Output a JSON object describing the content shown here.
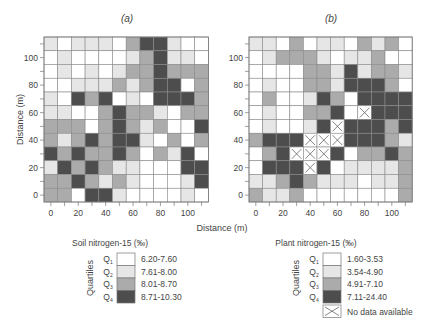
{
  "chart_data": [
    {
      "type": "heatmap",
      "panel_label": "(a)",
      "title": "(a)",
      "xlabel": "Distance (m)",
      "ylabel": "Distance (m)",
      "x_ticks": [
        "0",
        "20",
        "40",
        "60",
        "80",
        "100"
      ],
      "y_ticks": [
        "0",
        "20",
        "40",
        "60",
        "80",
        "100"
      ],
      "x_range": [
        0,
        110
      ],
      "y_range": [
        0,
        110
      ],
      "cell_spacing_m": 10,
      "rows_top_to_bottom": [
        [
          2,
          1,
          2,
          2,
          2,
          1,
          3,
          4,
          4,
          2,
          1,
          1
        ],
        [
          1,
          2,
          1,
          1,
          1,
          1,
          2,
          3,
          4,
          2,
          2,
          1
        ],
        [
          1,
          2,
          1,
          2,
          1,
          2,
          3,
          3,
          4,
          3,
          3,
          3
        ],
        [
          1,
          1,
          2,
          2,
          2,
          3,
          2,
          3,
          4,
          4,
          1,
          3
        ],
        [
          2,
          1,
          4,
          3,
          4,
          1,
          2,
          1,
          4,
          4,
          4,
          3
        ],
        [
          2,
          2,
          1,
          1,
          3,
          4,
          3,
          3,
          2,
          1,
          3,
          3
        ],
        [
          3,
          3,
          3,
          1,
          3,
          4,
          3,
          2,
          3,
          1,
          1,
          4
        ],
        [
          3,
          2,
          3,
          4,
          3,
          4,
          4,
          2,
          1,
          3,
          1,
          3
        ],
        [
          4,
          3,
          4,
          3,
          3,
          4,
          3,
          1,
          3,
          2,
          4,
          1
        ],
        [
          2,
          4,
          3,
          4,
          3,
          2,
          2,
          1,
          1,
          1,
          4,
          4
        ],
        [
          3,
          3,
          4,
          3,
          2,
          3,
          2,
          1,
          1,
          1,
          2,
          4
        ],
        [
          3,
          3,
          1,
          4,
          4,
          2,
          1,
          1,
          1,
          1,
          2,
          1
        ]
      ],
      "legend": {
        "title": "Soil nitrogen-15 (‰)",
        "axis_label": "Quartiles",
        "entries": [
          {
            "quartile": "Q1",
            "range": "6.20-7.60"
          },
          {
            "quartile": "Q2",
            "range": "7.61-8.00"
          },
          {
            "quartile": "Q3",
            "range": "8.01-8.70"
          },
          {
            "quartile": "Q4",
            "range": "8.71-10.30"
          }
        ]
      }
    },
    {
      "type": "heatmap",
      "panel_label": "(b)",
      "title": "(b)",
      "xlabel": "Distance (m)",
      "ylabel": "",
      "x_ticks": [
        "0",
        "20",
        "40",
        "60",
        "80",
        "100"
      ],
      "y_ticks": [
        "0",
        "20",
        "40",
        "60",
        "80",
        "100"
      ],
      "x_range": [
        0,
        110
      ],
      "y_range": [
        0,
        110
      ],
      "cell_spacing_m": 10,
      "rows_top_to_bottom": [
        [
          2,
          2,
          1,
          3,
          1,
          2,
          2,
          1,
          3,
          2,
          3,
          1
        ],
        [
          1,
          2,
          3,
          3,
          3,
          2,
          1,
          2,
          2,
          3,
          1,
          1
        ],
        [
          1,
          1,
          1,
          1,
          3,
          3,
          2,
          4,
          2,
          3,
          3,
          2
        ],
        [
          1,
          2,
          1,
          1,
          3,
          3,
          2,
          4,
          4,
          4,
          3,
          1
        ],
        [
          1,
          3,
          1,
          1,
          2,
          4,
          3,
          1,
          4,
          4,
          4,
          4
        ],
        [
          1,
          2,
          1,
          1,
          3,
          3,
          4,
          1,
          0,
          4,
          4,
          4
        ],
        [
          1,
          2,
          1,
          1,
          2,
          4,
          0,
          4,
          4,
          4,
          3,
          4
        ],
        [
          3,
          4,
          4,
          4,
          0,
          0,
          0,
          4,
          4,
          4,
          3,
          2
        ],
        [
          1,
          3,
          4,
          0,
          0,
          0,
          4,
          1,
          3,
          3,
          4,
          3
        ],
        [
          1,
          4,
          4,
          4,
          0,
          4,
          1,
          2,
          2,
          2,
          2,
          3
        ],
        [
          2,
          2,
          3,
          4,
          3,
          2,
          2,
          2,
          1,
          2,
          2,
          3
        ],
        [
          3,
          2,
          2,
          3,
          1,
          1,
          1,
          1,
          1,
          1,
          1,
          3
        ]
      ],
      "legend": {
        "title": "Plant nitrogen-15 (‰)",
        "axis_label": "Quartiles",
        "entries": [
          {
            "quartile": "Q1",
            "range": "1.60-3.53"
          },
          {
            "quartile": "Q2",
            "range": "3.54-4.90"
          },
          {
            "quartile": "Q3",
            "range": "4.91-7.10"
          },
          {
            "quartile": "Q4",
            "range": "7.11-24.40"
          },
          {
            "quartile": "",
            "range": "No data available"
          }
        ]
      }
    }
  ],
  "shared": {
    "xlabel": "Distance (m)",
    "quartile_colors": {
      "0": "#ffffff",
      "1": "#ffffff",
      "2": "#e6e6e6",
      "3": "#ababab",
      "4": "#4d4d4d"
    },
    "no_data_code": 0
  }
}
